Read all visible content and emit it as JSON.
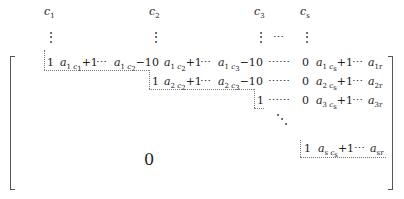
{
  "headers": {
    "c1": {
      "base": "c",
      "sub": "1"
    },
    "c2": {
      "base": "c",
      "sub": "2"
    },
    "c3": {
      "base": "c",
      "sub": "3"
    },
    "cs": {
      "base": "c",
      "sub": "s"
    }
  },
  "symbols": {
    "vdots": "⋮",
    "hdots": "⋯",
    "long_dots": "⋯⋯",
    "ddots": "⋱",
    "zero": "0",
    "one": "1",
    "big_zero": "0"
  },
  "rows": [
    {
      "id": "row-1",
      "entries": [
        "1",
        "a_{1 c1+1}",
        "⋯",
        "a_{1 c2−1}",
        "0",
        "a_{1 c2+1}",
        "⋯",
        "a_{1 c3−1}",
        "0",
        "⋯⋯",
        "0",
        "a_{1 cs+1}",
        "⋯",
        "a_{1r}"
      ]
    },
    {
      "id": "row-2",
      "entries": [
        "1",
        "a_{2 c2+1}",
        "⋯",
        "a_{2 c3−1}",
        "0",
        "⋯⋯",
        "0",
        "a_{2 cs+1}",
        "⋯",
        "a_{2r}"
      ]
    },
    {
      "id": "row-3",
      "entries": [
        "1",
        "⋯⋯",
        "0",
        "a_{3 cs+1}",
        "⋯",
        "a_{3r}"
      ]
    },
    {
      "id": "row-s",
      "entries": [
        "1",
        "a_{s cs+1}",
        "⋯",
        "a_{sr}"
      ]
    }
  ],
  "subscripts": {
    "r1_a": {
      "row": "1",
      "col": "c",
      "colsub": "1",
      "tail": "+1"
    },
    "r1_b": {
      "row": "1",
      "col": "c",
      "colsub": "2",
      "tail": "−1"
    },
    "r1_c": {
      "row": "1",
      "col": "c",
      "colsub": "2",
      "tail": "+1"
    },
    "r1_d": {
      "row": "1",
      "col": "c",
      "colsub": "3",
      "tail": "−1"
    },
    "r1_e": {
      "row": "1",
      "col": "c",
      "colsub": "s",
      "tail": "+1"
    },
    "r1_f": {
      "row": "1r"
    },
    "r2_a": {
      "row": "2",
      "col": "c",
      "colsub": "2",
      "tail": "+1"
    },
    "r2_b": {
      "row": "2",
      "col": "c",
      "colsub": "3",
      "tail": "−1"
    },
    "r2_c": {
      "row": "2",
      "col": "c",
      "colsub": "s",
      "tail": "+1"
    },
    "r2_d": {
      "row": "2r"
    },
    "r3_a": {
      "row": "3",
      "col": "c",
      "colsub": "s",
      "tail": "+1"
    },
    "r3_b": {
      "row": "3r"
    },
    "rs_a": {
      "row": "s",
      "col": "c",
      "colsub": "s",
      "tail": "+1"
    },
    "rs_b": {
      "row": "sr"
    }
  },
  "letter_a": "a"
}
